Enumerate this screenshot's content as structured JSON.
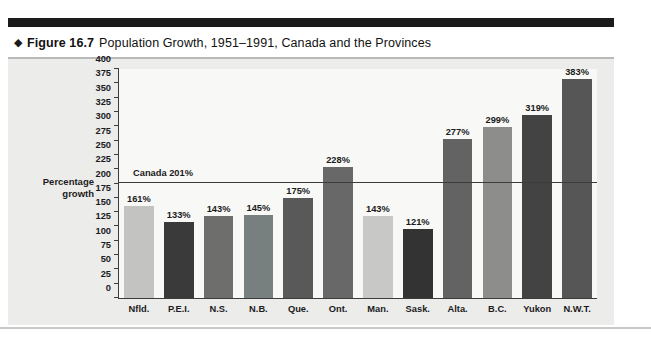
{
  "caption": {
    "diamond_icon": "diamond-bullet-icon",
    "figure_label": "Figure 16.7",
    "title": "Population Growth, 1951–1991, Canada and the Provinces"
  },
  "chart_data": {
    "type": "bar",
    "title": "Population Growth, 1951–1991, Canada and the Provinces",
    "xlabel": "",
    "ylabel": "Percentage growth",
    "ylim": [
      0,
      400
    ],
    "ytick_step": 25,
    "yticks": [
      0,
      25,
      50,
      75,
      100,
      125,
      150,
      175,
      200,
      225,
      250,
      275,
      300,
      325,
      350,
      375,
      400
    ],
    "grid": false,
    "legend": "none",
    "categories": [
      "Nfld.",
      "P.E.I.",
      "N.S.",
      "N.B.",
      "Que.",
      "Ont.",
      "Man.",
      "Sask.",
      "Alta.",
      "B.C.",
      "Yukon",
      "N.W.T."
    ],
    "values": [
      161,
      133,
      143,
      145,
      175,
      228,
      143,
      121,
      277,
      299,
      319,
      383
    ],
    "value_labels": [
      "161%",
      "133%",
      "143%",
      "145%",
      "175%",
      "228%",
      "143%",
      "121%",
      "277%",
      "299%",
      "319%",
      "383%"
    ],
    "bar_colors": [
      "#c3c3c2",
      "#3a3a3a",
      "#6e6e6d",
      "#78807f",
      "#595959",
      "#686868",
      "#c8c8c6",
      "#333333",
      "#636363",
      "#8d8d8b",
      "#434343",
      "#565656"
    ],
    "annotations": [
      {
        "name": "canada-reference-line",
        "label": "Canada 201%",
        "value": 201
      }
    ]
  },
  "axis": {
    "y_title_line1": "Percentage",
    "y_title_line2": "growth"
  },
  "colors": {
    "panel_background": "#ececeb",
    "plot_background": "#f8f8f6",
    "axis": "#3c3c3c",
    "rule_top": "#1b1b1b",
    "rule_bottom": "#c9c9c9"
  }
}
